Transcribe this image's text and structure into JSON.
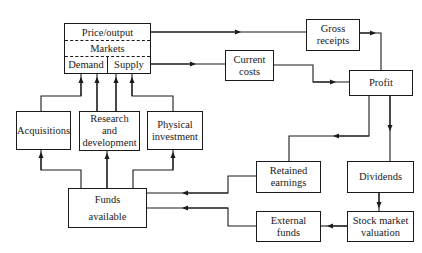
{
  "diagram": {
    "main_box": {
      "price_output": "Price/output",
      "markets": "Markets",
      "demand": "Demand",
      "supply": "Supply"
    },
    "nodes": {
      "acquisitions": "Acquisitions",
      "research_development": "Research\nand\ndevelopment",
      "physical_investment": "Physical\ninvestment",
      "funds_available": "Funds\navailable",
      "gross_receipts": "Gross\nreceipts",
      "current_costs": "Current\ncosts",
      "profit": "Profit",
      "retained_earnings": "Retained\nearnings",
      "dividends": "Dividends",
      "external_funds": "External\nfunds",
      "stock_market_valuation": "Stock market\nvaluation"
    },
    "edges": [
      {
        "from": "Price/output",
        "to": "Gross receipts"
      },
      {
        "from": "Supply",
        "to": "Current costs"
      },
      {
        "from": "Gross receipts",
        "to": "Profit"
      },
      {
        "from": "Current costs",
        "to": "Profit"
      },
      {
        "from": "Profit",
        "to": "Retained earnings"
      },
      {
        "from": "Profit",
        "to": "Dividends"
      },
      {
        "from": "Dividends",
        "to": "Stock market valuation"
      },
      {
        "from": "Stock market valuation",
        "to": "External funds"
      },
      {
        "from": "Retained earnings",
        "to": "Funds available"
      },
      {
        "from": "External funds",
        "to": "Funds available"
      },
      {
        "from": "Funds available",
        "to": "Acquisitions"
      },
      {
        "from": "Funds available",
        "to": "Research and development"
      },
      {
        "from": "Funds available",
        "to": "Physical investment"
      },
      {
        "from": "Acquisitions",
        "to": "Demand"
      },
      {
        "from": "Research and development",
        "to": "Demand"
      },
      {
        "from": "Research and development",
        "to": "Supply"
      },
      {
        "from": "Physical investment",
        "to": "Supply"
      }
    ]
  }
}
